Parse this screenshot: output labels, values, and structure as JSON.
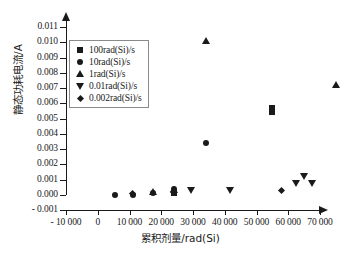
{
  "chart_data": {
    "type": "scatter",
    "title": "",
    "xlabel": "累积剂量/rad(Si)",
    "ylabel": "静态功耗电流/A",
    "xlim": [
      -10000,
      70000
    ],
    "ylim": [
      -0.001,
      0.011
    ],
    "xticks": [
      -10000,
      0,
      10000,
      20000,
      30000,
      40000,
      50000,
      60000,
      70000
    ],
    "xtick_labels": [
      "- 10 000",
      "0",
      "10 000",
      "20 000",
      "30 000",
      "40 000",
      "50 000",
      "60 000",
      "70 000"
    ],
    "yticks": [
      -0.001,
      0.0,
      0.001,
      0.002,
      0.003,
      0.004,
      0.005,
      0.006,
      0.007,
      0.008,
      0.009,
      0.01,
      0.011
    ],
    "ytick_labels": [
      "- 0.001",
      "0.000",
      "0.001",
      "0.002",
      "0.003",
      "0.004",
      "0.005",
      "0.006",
      "0.007",
      "0.008",
      "0.009",
      "0.010",
      "0.011"
    ],
    "grid": false,
    "legend_position": "upper left",
    "marker_color": "#1a1a1a",
    "series": [
      {
        "name": "100rad(Si)/s",
        "marker": "square",
        "points": [
          {
            "x": 24000,
            "y": 0.0001
          },
          {
            "x": 55000,
            "y": 0.0057
          },
          {
            "x": 55000,
            "y": 0.0054
          }
        ]
      },
      {
        "name": "10rad(Si)/s",
        "marker": "circle",
        "points": [
          {
            "x": 5500,
            "y": 0.0
          },
          {
            "x": 11000,
            "y": 0.0
          },
          {
            "x": 17500,
            "y": 0.0001
          },
          {
            "x": 24000,
            "y": 0.0004
          },
          {
            "x": 34000,
            "y": 0.0034
          }
        ]
      },
      {
        "name": "1rad(Si)/s",
        "marker": "triangle-up",
        "points": [
          {
            "x": 17500,
            "y": 0.0002
          },
          {
            "x": 24000,
            "y": 0.0003
          },
          {
            "x": 34000,
            "y": 0.0101
          },
          {
            "x": 75000,
            "y": 0.0072
          }
        ]
      },
      {
        "name": "0.01rad(Si)/s",
        "marker": "triangle-down",
        "points": [
          {
            "x": 29500,
            "y": 0.0003
          },
          {
            "x": 41500,
            "y": 0.0003
          },
          {
            "x": 62500,
            "y": 0.0008
          },
          {
            "x": 65000,
            "y": 0.0012
          },
          {
            "x": 67500,
            "y": 0.0008
          }
        ]
      },
      {
        "name": "0.002rad(Si)/s",
        "marker": "diamond",
        "points": [
          {
            "x": 11000,
            "y": 0.0001
          },
          {
            "x": 24000,
            "y": 0.0002
          },
          {
            "x": 58000,
            "y": 0.0003
          }
        ]
      }
    ]
  }
}
